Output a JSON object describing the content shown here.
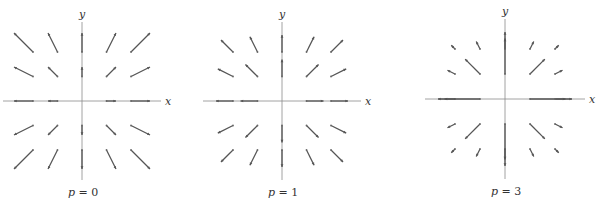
{
  "chart_data": [
    {
      "type": "vector-field",
      "caption": "p = 0",
      "caption_var": "p",
      "caption_val": "0",
      "xlabel": "x",
      "ylabel": "y",
      "p": 0,
      "origin": [
        82,
        101
      ],
      "spacing": 24.5,
      "scale": 9.5,
      "grid": [
        -2,
        -1,
        1,
        2
      ],
      "include_axes_points": true
    },
    {
      "type": "vector-field",
      "caption": "p = 1",
      "caption_var": "p",
      "caption_val": "1",
      "xlabel": "x",
      "ylabel": "y",
      "p": 1,
      "origin": [
        282,
        101
      ],
      "spacing": 24.5,
      "scale": 17,
      "grid": [
        -2,
        -1,
        1,
        2
      ],
      "include_axes_points": true
    },
    {
      "type": "vector-field",
      "caption": "p = 3",
      "caption_var": "p",
      "caption_val": "3",
      "xlabel": "x",
      "ylabel": "y",
      "p": 3,
      "origin": [
        505,
        99
      ],
      "spacing": 25,
      "scale": 42,
      "grid": [
        -2,
        -1,
        1,
        2
      ],
      "include_axes_points": true
    }
  ]
}
